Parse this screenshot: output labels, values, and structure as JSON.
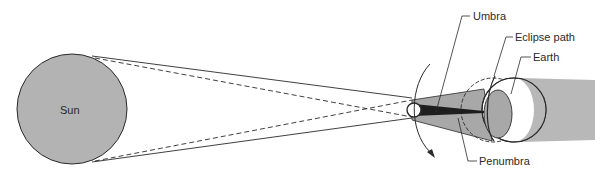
{
  "diagram": {
    "type": "solar-eclipse-geometry",
    "labels": {
      "sun": "Sun",
      "umbra": "Umbra",
      "eclipse_path": "Eclipse path",
      "earth": "Earth",
      "penumbra": "Penumbra"
    },
    "colors": {
      "sun_fill": "#b3b3b3",
      "earth_shadow_fill": "#b8b8b8",
      "penumbra_fill": "#a8a8a8",
      "umbra_fill": "#1e1e1e",
      "line": "#2a2a2a",
      "background": "#ffffff"
    }
  }
}
